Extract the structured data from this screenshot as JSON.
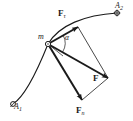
{
  "figure": {
    "kind": "physics-vector-diagram",
    "background_color": "#ffffff",
    "ink_color": "#1a1a1a"
  },
  "labels": {
    "force_tangential": {
      "symbol": "F",
      "subscript": "τ"
    },
    "force_resultant": {
      "symbol": "F",
      "subscript": ""
    },
    "force_normal": {
      "symbol": "F",
      "subscript": "n"
    },
    "mass": {
      "symbol": "m",
      "subscript": ""
    },
    "point_start": {
      "symbol": "A",
      "subscript": "1"
    },
    "point_end": {
      "symbol": "A",
      "subscript": "2"
    },
    "angle": {
      "symbol": "α"
    }
  },
  "geometry": {
    "particle_point": {
      "x": 48,
      "y": 44
    },
    "point_a1": {
      "x": 13,
      "y": 104
    },
    "point_a2": {
      "x": 117,
      "y": 13
    },
    "tangential_tip": {
      "x": 78,
      "y": 27
    },
    "resultant_tip": {
      "x": 108,
      "y": 78
    },
    "normal_tip": {
      "x": 82,
      "y": 100
    },
    "angle_arc_radius": 17,
    "trajectory_path": "M 13 104 C 26 96 38 72 48 44 C 58 26 84 16 117 13",
    "stroke_width_curve": 1.1,
    "stroke_width_vector": 2.0,
    "stroke_width_thin": 0.8
  }
}
